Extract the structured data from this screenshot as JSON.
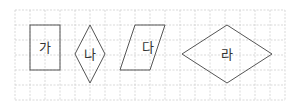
{
  "grid": {
    "x0": 15,
    "y0": 10,
    "cell": 15,
    "cols": 18,
    "rows": 6,
    "color": "#cfcfcf"
  },
  "shapes": [
    {
      "id": "ga",
      "label": "가",
      "type": "rectangle"
    },
    {
      "id": "na",
      "label": "나",
      "type": "rhombus"
    },
    {
      "id": "da",
      "label": "다",
      "type": "parallelogram"
    },
    {
      "id": "ra",
      "label": "라",
      "type": "rhombus"
    }
  ],
  "stroke_color": "#555555"
}
